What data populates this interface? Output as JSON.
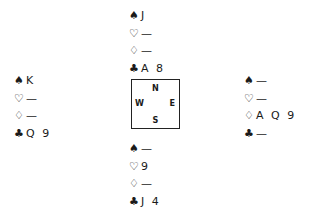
{
  "diagram": {
    "type": "bridge-hand",
    "suit_symbols": {
      "spades": "♠",
      "hearts": "♡",
      "diamonds": "♢",
      "clubs": "♣"
    },
    "hands": {
      "north": {
        "spades": "J",
        "hearts": "—",
        "diamonds": "—",
        "clubs": "A 8"
      },
      "west": {
        "spades": "K",
        "hearts": "—",
        "diamonds": "—",
        "clubs": "Q 9"
      },
      "east": {
        "spades": "—",
        "hearts": "—",
        "diamonds": "A Q 9",
        "clubs": "—"
      },
      "south": {
        "spades": "—",
        "hearts": "9",
        "diamonds": "—",
        "clubs": "J 4"
      }
    },
    "compass": {
      "n": "N",
      "s": "S",
      "w": "W",
      "e": "E"
    }
  }
}
